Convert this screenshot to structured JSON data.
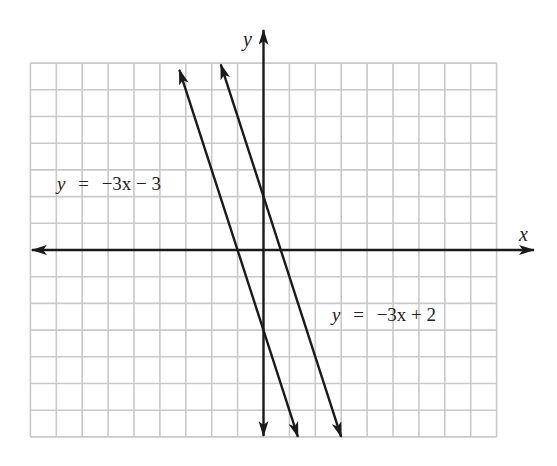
{
  "chart_data": {
    "type": "line",
    "title": "",
    "xlabel": "x",
    "ylabel": "y",
    "xlim": [
      -9,
      9
    ],
    "ylim": [
      -7,
      7
    ],
    "grid": true,
    "grid_step": 1,
    "axis_arrows": true,
    "series": [
      {
        "name": "y = −3x − 3",
        "slope": -3,
        "intercept": -3,
        "x": [
          -3.25,
          1.33
        ],
        "y": [
          6.75,
          -7.0
        ],
        "arrows": "both"
      },
      {
        "name": "y = −3x + 2",
        "slope": -3,
        "intercept": 2,
        "x": [
          -1.65,
          3.0
        ],
        "y": [
          6.95,
          -7.0
        ],
        "arrows": "both"
      }
    ],
    "annotations": [
      {
        "text": "y = −3x − 3",
        "x": -7.8,
        "y": 2.3
      },
      {
        "text": "y = −3x + 2",
        "x": 2.65,
        "y": -2.6
      }
    ]
  },
  "labels": {
    "x_axis": "x",
    "y_axis": "y",
    "line1": {
      "y": "y",
      "eq": "=",
      "rhs": "−3x − 3"
    },
    "line2": {
      "y": "y",
      "eq": "=",
      "rhs": "−3x + 2"
    }
  },
  "colors": {
    "grid": "#c9c9c9",
    "ink": "#1a1a1a",
    "background": "#ffffff"
  }
}
